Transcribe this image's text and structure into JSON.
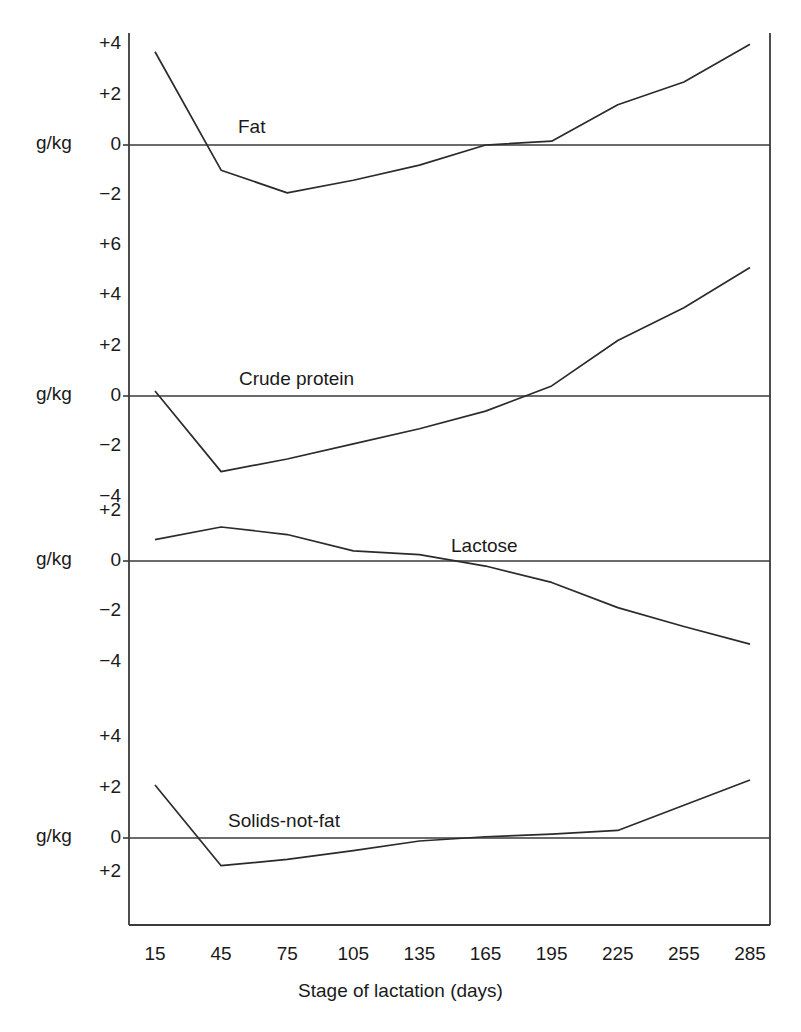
{
  "figure": {
    "unit_label": "g/kg",
    "xaxis_title": "Stage of lactation (days)",
    "line_color": "#2b2b2b",
    "axis_color": "#3a3a3a",
    "background": "#ffffff"
  },
  "xticks": [
    "15",
    "45",
    "75",
    "105",
    "135",
    "165",
    "195",
    "225",
    "255",
    "285"
  ],
  "panels": [
    {
      "name": "Fat",
      "label": "Fat",
      "yticks": [
        "+4",
        "+2",
        "0",
        "-2"
      ],
      "ytick_values": [
        4,
        2,
        0,
        -2
      ]
    },
    {
      "name": "Crude protein",
      "label": "Crude protein",
      "yticks": [
        "+6",
        "+4",
        "+2",
        "0",
        "-2",
        "-4"
      ],
      "ytick_values": [
        6,
        4,
        2,
        0,
        -2,
        -4
      ]
    },
    {
      "name": "Lactose",
      "label": "Lactose",
      "yticks": [
        "+2",
        "0",
        "-2",
        "-4"
      ],
      "ytick_values": [
        2,
        0,
        -2,
        -4
      ]
    },
    {
      "name": "Solids-not-fat",
      "label": "Solids-not-fat",
      "yticks": [
        "+4",
        "+2",
        "0",
        "+2"
      ],
      "ytick_values": [
        4,
        2,
        0,
        -2
      ]
    }
  ],
  "chart_data": {
    "type": "line",
    "title": "",
    "xlabel": "Stage of lactation (days)",
    "ylabel": "g/kg",
    "grid": false,
    "legend": "inline-labels",
    "x": [
      15,
      45,
      75,
      105,
      135,
      165,
      195,
      225,
      255,
      285
    ],
    "panels": [
      {
        "label": "Fat",
        "ylabel": "g/kg",
        "ylim": [
          -3,
          4.6
        ],
        "yticks": [
          4,
          2,
          0,
          -2
        ],
        "ytick_labels": [
          "+4",
          "+2",
          "0",
          "-2"
        ],
        "values": [
          3.7,
          -1.0,
          -1.9,
          -1.4,
          -0.8,
          0.0,
          0.15,
          1.6,
          2.5,
          4.0
        ]
      },
      {
        "label": "Crude protein",
        "ylabel": "g/kg",
        "ylim": [
          -5,
          6.6
        ],
        "yticks": [
          6,
          4,
          2,
          0,
          -2,
          -4
        ],
        "ytick_labels": [
          "+6",
          "+4",
          "+2",
          "0",
          "-2",
          "-4"
        ],
        "values": [
          0.2,
          -3.0,
          -2.5,
          -1.9,
          -1.3,
          -0.6,
          0.4,
          2.2,
          3.5,
          5.1
        ]
      },
      {
        "label": "Lactose",
        "ylabel": "g/kg",
        "ylim": [
          -5,
          2.6
        ],
        "yticks": [
          2,
          0,
          -2,
          -4
        ],
        "ytick_labels": [
          "+2",
          "0",
          "-2",
          "-4"
        ],
        "values": [
          0.85,
          1.35,
          1.05,
          0.4,
          0.25,
          -0.2,
          -0.85,
          -1.85,
          -2.6,
          -3.3
        ]
      },
      {
        "label": "Solids-not-fat",
        "ylabel": "g/kg",
        "ylim": [
          -2.6,
          4.6
        ],
        "yticks": [
          4,
          2,
          0,
          -2
        ],
        "ytick_labels": [
          "+4",
          "+2",
          "0",
          "+2"
        ],
        "values": [
          2.1,
          -1.1,
          -0.85,
          -0.5,
          -0.12,
          0.05,
          0.15,
          0.3,
          1.3,
          2.3
        ]
      }
    ]
  }
}
